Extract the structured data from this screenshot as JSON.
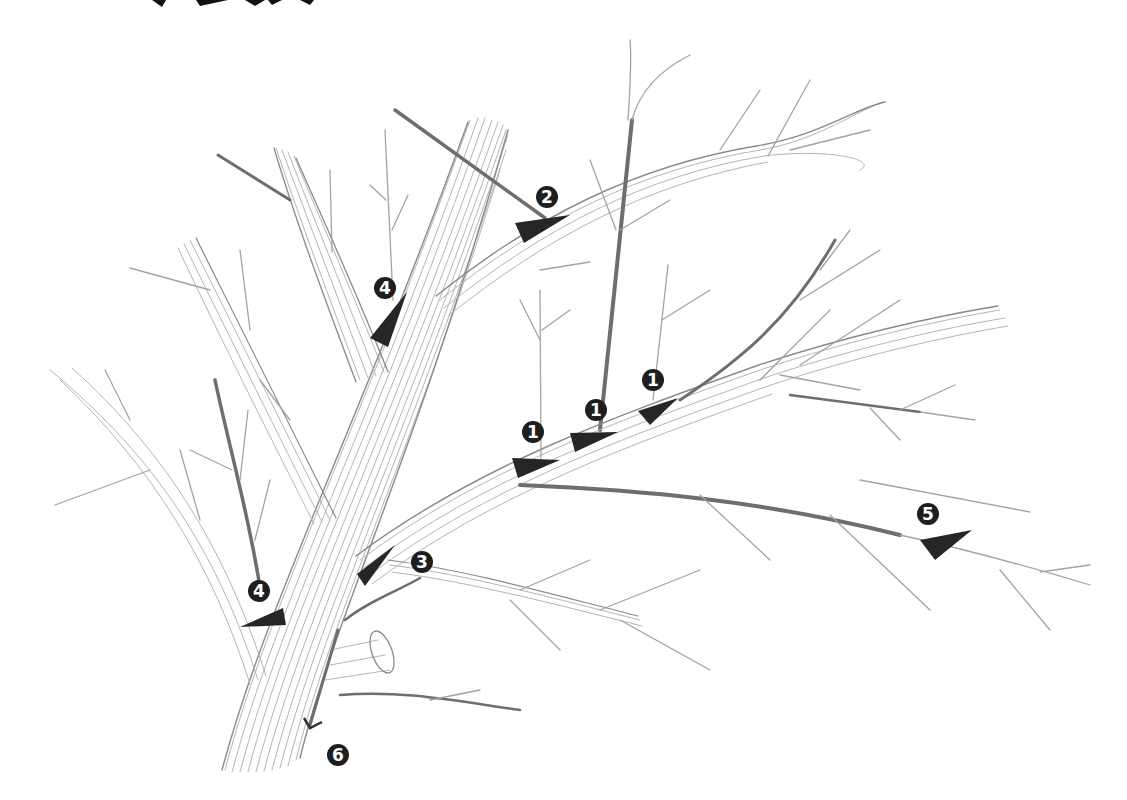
{
  "diagram": {
    "title_fragment": "",
    "colors": {
      "marker": "#262626",
      "badge": "#1e1e1e",
      "badge_text": "#ffffff",
      "branch": "#8a8a8a"
    },
    "markers": [
      {
        "id": "m1a",
        "label": "1",
        "badge": {
          "x": 533,
          "y": 432
        },
        "wedge": "512,458 560,460 518,478"
      },
      {
        "id": "m1b",
        "label": "1",
        "badge": {
          "x": 596,
          "y": 410
        },
        "wedge": "570,433 618,432 575,452"
      },
      {
        "id": "m1c",
        "label": "1",
        "badge": {
          "x": 653,
          "y": 380
        },
        "wedge": "638,411 678,398 650,425"
      },
      {
        "id": "m2",
        "label": "2",
        "badge": {
          "x": 547,
          "y": 197
        },
        "wedge": "515,223 570,215 524,243"
      },
      {
        "id": "m3",
        "label": "3",
        "badge": {
          "x": 422,
          "y": 562
        },
        "wedge": "357,574 395,545 365,586"
      },
      {
        "id": "m4a",
        "label": "4",
        "badge": {
          "x": 385,
          "y": 288
        },
        "wedge": "370,338 407,292 388,347"
      },
      {
        "id": "m4b",
        "label": "4",
        "badge": {
          "x": 259,
          "y": 591
        },
        "wedge": "240,627 283,608 286,625"
      },
      {
        "id": "m5",
        "label": "5",
        "badge": {
          "x": 928,
          "y": 514
        },
        "wedge": "920,540 972,530 935,560"
      },
      {
        "id": "m6",
        "label": "6",
        "badge": {
          "x": 338,
          "y": 755
        },
        "wedge": "302,722 318,735 310,727"
      }
    ]
  }
}
